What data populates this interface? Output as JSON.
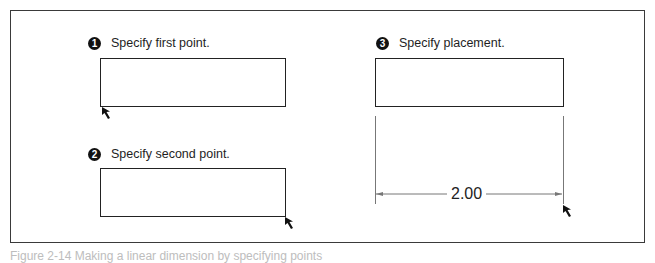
{
  "figure": {
    "steps": [
      {
        "number": "1",
        "label": "Specify first point."
      },
      {
        "number": "2",
        "label": "Specify second point."
      },
      {
        "number": "3",
        "label": "Specify placement."
      }
    ],
    "dimension": {
      "value": "2.00"
    },
    "caption": "Figure 2-14 Making a linear dimension by specifying points"
  },
  "colors": {
    "frame": "#3a3a3a",
    "badge": "#111111",
    "dimension_line": "#777777",
    "caption": "#bdbdbd"
  }
}
